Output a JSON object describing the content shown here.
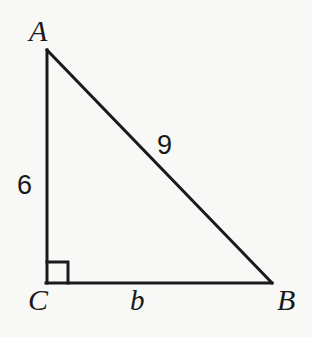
{
  "figure": {
    "kind": "right-triangle-diagram",
    "background_color": "#f8f8f6",
    "stroke_color": "#1a1a1a",
    "stroke_width": 3,
    "canvas": {
      "width": 312,
      "height": 337
    }
  },
  "vertices": {
    "a": {
      "label": "A",
      "x": 47,
      "y": 50
    },
    "b": {
      "label": "B",
      "x": 272,
      "y": 283
    },
    "c": {
      "label": "C",
      "x": 47,
      "y": 283
    }
  },
  "sides": {
    "leg_ac": {
      "label": "6",
      "from": "A",
      "to": "C"
    },
    "leg_cb": {
      "label": "b",
      "from": "C",
      "to": "B"
    },
    "hypotenuse_ab": {
      "label": "9",
      "from": "A",
      "to": "B"
    }
  },
  "right_angle": {
    "at_vertex": "C",
    "marker": "square",
    "size": 21
  }
}
